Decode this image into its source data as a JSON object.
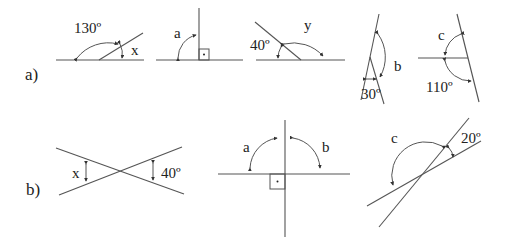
{
  "sections": {
    "a": {
      "label": "a)"
    },
    "b": {
      "label": "b)"
    }
  },
  "figures": {
    "a1": {
      "known": "130º",
      "unknown": "x"
    },
    "a2": {
      "unknown": "a",
      "marker": "right-angle"
    },
    "a3": {
      "known": "40º",
      "unknown": "y"
    },
    "a4": {
      "unknown": "b",
      "known": "30º"
    },
    "a5": {
      "unknown": "c",
      "known": "110º"
    },
    "b1": {
      "unknown": "x",
      "known": "40º"
    },
    "b2": {
      "unknown_left": "a",
      "unknown_right": "b",
      "marker": "right-angle"
    },
    "b3": {
      "unknown": "c",
      "known": "20º"
    }
  }
}
